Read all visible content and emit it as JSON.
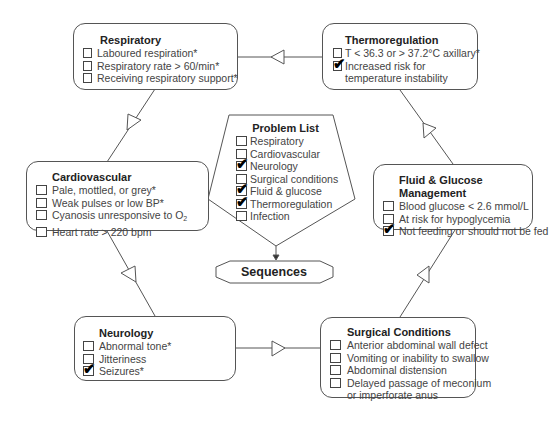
{
  "diagram": {
    "type": "cyclic-flow-with-center",
    "boxes": {
      "respiratory": {
        "title": "Respiratory",
        "items": [
          {
            "label": "Laboured respiration*",
            "checked": false
          },
          {
            "label": "Respiratory rate > 60/min*",
            "checked": false
          },
          {
            "label": "Receiving respiratory support*",
            "checked": false
          }
        ]
      },
      "thermoregulation": {
        "title": "Thermoregulation",
        "items": [
          {
            "label": "T < 36.3 or > 37.2°C axillary*",
            "checked": false
          },
          {
            "label": "Increased risk for",
            "label2": "temperature instability",
            "checked": true
          }
        ]
      },
      "cardiovascular": {
        "title": "Cardiovascular",
        "items": [
          {
            "label": "Pale, mottled, or grey*",
            "checked": false
          },
          {
            "label": "Weak pulses or low BP*",
            "checked": false
          },
          {
            "label": "Cyanosis unresponsive to O",
            "subscript": "2",
            "checked": false
          },
          {
            "label": "Heart rate > 220 bpm",
            "checked": false
          }
        ]
      },
      "fluid_glucose": {
        "title": "Fluid & Glucose Management",
        "items": [
          {
            "label": "Blood glucose < 2.6 mmol/L",
            "checked": false
          },
          {
            "label": "At risk for hypoglycemia",
            "checked": false
          },
          {
            "label": "Not feeding or should not be fed",
            "checked": true
          }
        ]
      },
      "neurology": {
        "title": "Neurology",
        "items": [
          {
            "label": "Abnormal tone*",
            "checked": false
          },
          {
            "label": "Jitteriness",
            "checked": false
          },
          {
            "label": "Seizures*",
            "checked": true
          }
        ]
      },
      "surgical": {
        "title": "Surgical Conditions",
        "items": [
          {
            "label": "Anterior abdominal wall defect",
            "checked": false
          },
          {
            "label": "Vomiting or inability to swallow",
            "checked": false
          },
          {
            "label": "Abdominal distension",
            "checked": false
          },
          {
            "label": "Delayed passage of meconium",
            "label2": "or imperforate anus",
            "checked": false
          }
        ]
      }
    },
    "problem_list": {
      "title": "Problem List",
      "items": [
        {
          "label": "Respiratory",
          "checked": false
        },
        {
          "label": "Cardiovascular",
          "checked": false
        },
        {
          "label": "Neurology",
          "checked": true
        },
        {
          "label": "Surgical conditions",
          "checked": false
        },
        {
          "label": "Fluid & glucose",
          "checked": true
        },
        {
          "label": "Thermoregulation",
          "checked": true
        },
        {
          "label": "Infection",
          "checked": false
        }
      ]
    },
    "sequences": {
      "label": "Sequences"
    },
    "check_glyph": "✔"
  }
}
